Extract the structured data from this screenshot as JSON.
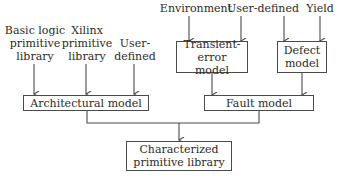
{
  "diagram": {
    "inputs_left": [
      {
        "id": "basic",
        "lines": [
          "Basic logic",
          "primitive",
          "library"
        ]
      },
      {
        "id": "xilinx",
        "lines": [
          "Xilinx",
          "primitive",
          "library"
        ]
      },
      {
        "id": "user_left",
        "lines": [
          "User-",
          "defined"
        ]
      }
    ],
    "inputs_right": [
      {
        "id": "environment",
        "label": "Environment"
      },
      {
        "id": "user_right",
        "label": "User-defined"
      },
      {
        "id": "yield",
        "label": "Yield"
      }
    ],
    "boxes": {
      "transient": {
        "lines": [
          "Transient-error",
          "model"
        ]
      },
      "defect": {
        "lines": [
          "Defect",
          "model"
        ]
      },
      "architectural": {
        "label": "Architectural model"
      },
      "fault": {
        "label": "Fault model"
      },
      "characterized": {
        "lines": [
          "Characterized",
          "primitive library"
        ]
      }
    },
    "edges": [
      [
        "Basic logic primitive library",
        "Architectural model"
      ],
      [
        "Xilinx primitive library",
        "Architectural model"
      ],
      [
        "User-defined",
        "Architectural model"
      ],
      [
        "Environment",
        "Transient-error model"
      ],
      [
        "User-defined",
        "Transient-error model"
      ],
      [
        "User-defined",
        "Defect model"
      ],
      [
        "Yield",
        "Defect model"
      ],
      [
        "Transient-error model",
        "Fault model"
      ],
      [
        "Defect model",
        "Fault model"
      ],
      [
        "Architectural model",
        "Characterized primitive library"
      ],
      [
        "Fault model",
        "Characterized primitive library"
      ]
    ],
    "colors": {
      "line": "#4a4a4a",
      "text": "#2b2b2b",
      "background": "#ffffff"
    }
  }
}
